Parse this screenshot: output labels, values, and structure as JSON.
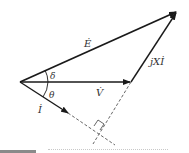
{
  "diagram": {
    "labels": {
      "E": "Ė",
      "V": "V̇",
      "I": "İ",
      "jXI": "jXİ",
      "delta": "δ",
      "theta": "θ"
    },
    "colors": {
      "line": "#1a1a1a",
      "dashed": "#555555",
      "text": "#333333"
    }
  }
}
